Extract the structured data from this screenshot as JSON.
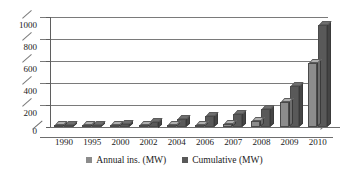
{
  "chart_data": {
    "type": "bar",
    "title": "",
    "subtitle": "",
    "xlabel": "",
    "ylabel": "",
    "categories": [
      "1990",
      "1995",
      "2000",
      "2002",
      "2004",
      "2006",
      "2007",
      "2008",
      "2009",
      "2010"
    ],
    "series": [
      {
        "name": "Annual ins. (MW)",
        "color": "#8c8c8c",
        "values": [
          3,
          5,
          8,
          12,
          15,
          20,
          28,
          55,
          225,
          580
        ]
      },
      {
        "name": "Cumulative (MW)",
        "color": "#595959",
        "values": [
          5,
          15,
          30,
          50,
          75,
          100,
          120,
          160,
          370,
          930
        ]
      }
    ],
    "ylim": [
      0,
      1000
    ],
    "yticks": [
      0,
      200,
      400,
      600,
      800,
      1000
    ],
    "ytick_labels": [
      "0",
      "200",
      "400",
      "600",
      "800",
      "1000"
    ],
    "grid": true,
    "grid_axis": "y",
    "legend_position": "bottom",
    "style": "3d-clustered-column"
  },
  "legend": {
    "entries": [
      {
        "label": "Annual ins. (MW)",
        "color": "#8c8c8c"
      },
      {
        "label": "Cumulative (MW)",
        "color": "#595959"
      }
    ]
  },
  "colors": {
    "series_1": "#8c8c8c",
    "series_2": "#595959",
    "axis": "#5f5f5f",
    "grid": "#7a7a7a",
    "text": "#1a1a1a",
    "background": "#ffffff"
  }
}
